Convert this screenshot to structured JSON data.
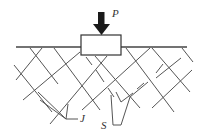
{
  "diagram": {
    "labels": {
      "load": "P",
      "joints": "J",
      "slip": "S"
    },
    "colors": {
      "line": "#555555",
      "ground": "#444444",
      "arrow": "#1a1a1a",
      "background": "#ffffff"
    },
    "ground_line": {
      "x1": 16,
      "y1": 47,
      "x2": 187,
      "y2": 47
    },
    "footing": {
      "x": 81,
      "y": 35,
      "width": 40,
      "height": 20
    },
    "load_arrow": {
      "shaft": [
        98,
        12,
        104,
        24
      ],
      "head": [
        93,
        24,
        110,
        24,
        101.5,
        35
      ]
    },
    "joint_set_a": [
      [
        30,
        48,
        58,
        84
      ],
      [
        54,
        48,
        100,
        110
      ],
      [
        14,
        65,
        52,
        112
      ],
      [
        95,
        55,
        140,
        108
      ],
      [
        152,
        47,
        190,
        92
      ],
      [
        126,
        47,
        174,
        112
      ],
      [
        182,
        48,
        192,
        62
      ]
    ],
    "joint_set_b": [
      [
        42,
        47,
        16,
        80
      ],
      [
        80,
        50,
        23,
        100
      ],
      [
        107,
        55,
        50,
        124
      ],
      [
        150,
        48,
        82,
        110
      ],
      [
        180,
        58,
        155,
        110
      ],
      [
        192,
        70,
        152,
        108
      ]
    ],
    "slip_surfaces": [
      [
        86,
        57,
        114,
        97
      ],
      [
        114,
        97,
        122,
        102
      ],
      [
        122,
        102,
        140,
        89
      ],
      [
        140,
        89,
        145,
        82
      ],
      [
        157,
        72,
        163,
        62
      ]
    ]
  }
}
